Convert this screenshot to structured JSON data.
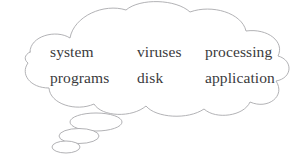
{
  "diagram": {
    "type": "thought-bubble",
    "colors": {
      "background": "#ffffff",
      "outline": "#a9a9ad",
      "text": "#3a3a3c"
    },
    "bubble": {
      "name": "thought-cloud",
      "shape": "scalloped cloud"
    },
    "trail": {
      "name": "thought-trail",
      "count": 3,
      "shape": "ellipse"
    },
    "words": {
      "rows": [
        {
          "cells": [
            {
              "label": "system"
            },
            {
              "label": "viruses"
            },
            {
              "label": "processing"
            }
          ]
        },
        {
          "cells": [
            {
              "label": "programs"
            },
            {
              "label": "disk"
            },
            {
              "label": "application"
            }
          ]
        }
      ]
    }
  }
}
